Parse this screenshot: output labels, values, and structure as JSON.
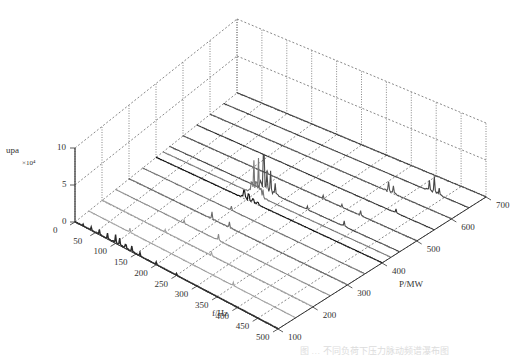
{
  "chart_data": {
    "type": "waterfall-3d",
    "title": "",
    "xlabel": "f/Hz",
    "ylabel": "P/MW",
    "zlabel": "upa",
    "z_multiplier": "×10⁴",
    "x_ticks": [
      0,
      50,
      100,
      150,
      200,
      250,
      300,
      350,
      400,
      450,
      500
    ],
    "y_ticks": [
      100,
      200,
      300,
      400,
      500,
      600,
      700
    ],
    "z_ticks": [
      0,
      5,
      10
    ],
    "xlim": [
      0,
      500
    ],
    "ylim": [
      100,
      700
    ],
    "zlim": [
      0,
      10
    ],
    "grid": true,
    "series": [
      {
        "name": "P=100",
        "power": 100,
        "color": "#2a2a2a",
        "peaks": [
          [
            20,
            0.3
          ],
          [
            40,
            0.5
          ],
          [
            60,
            0.7
          ],
          [
            80,
            0.8
          ],
          [
            100,
            1.2
          ],
          [
            110,
            1.0
          ],
          [
            125,
            0.9
          ],
          [
            140,
            0.8
          ],
          [
            160,
            0.5
          ],
          [
            200,
            0.4
          ],
          [
            250,
            0.3
          ]
        ]
      },
      {
        "name": "P=150",
        "power": 150,
        "color": "#a0a0a0",
        "peaks": [
          [
            100,
            0.6
          ],
          [
            350,
            0.5
          ]
        ]
      },
      {
        "name": "P=200",
        "power": 200,
        "color": "#a0a0a0",
        "peaks": [
          [
            150,
            0.4
          ],
          [
            260,
            0.5
          ]
        ]
      },
      {
        "name": "P=250",
        "power": 250,
        "color": "#8a8a8a",
        "peaks": [
          [
            160,
            0.5
          ],
          [
            240,
            0.9
          ]
        ]
      },
      {
        "name": "P=300",
        "power": 300,
        "color": "#6a6a6a",
        "peaks": [
          [
            190,
            1.0
          ],
          [
            230,
            0.8
          ]
        ]
      },
      {
        "name": "P=350",
        "power": 350,
        "color": "#707070",
        "peaks": [
          [
            200,
            0.6
          ]
        ]
      },
      {
        "name": "P=400",
        "power": 400,
        "color": "#111111",
        "peaks": [
          [
            195,
            1.8
          ],
          [
            205,
            1.5
          ],
          [
            215,
            0.9
          ],
          [
            225,
            0.6
          ]
        ]
      },
      {
        "name": "P=425",
        "power": 425,
        "color": "#777777",
        "peaks": [
          [
            195,
            2.5
          ],
          [
            200,
            4.6
          ],
          [
            205,
            3.0
          ],
          [
            210,
            5.2
          ],
          [
            215,
            2.0
          ],
          [
            220,
            1.2
          ]
        ]
      },
      {
        "name": "P=450",
        "power": 450,
        "color": "#4a4a4a",
        "peaks": [
          [
            205,
            7.8
          ],
          [
            212,
            2.5
          ],
          [
            220,
            3.0
          ],
          [
            230,
            1.6
          ],
          [
            300,
            0.5
          ],
          [
            380,
            0.8
          ]
        ]
      },
      {
        "name": "P=500",
        "power": 500,
        "color": "#555555",
        "peaks": [
          [
            180,
            0.4
          ],
          [
            300,
            0.5
          ],
          [
            340,
            0.4
          ],
          [
            380,
            0.7
          ]
        ]
      },
      {
        "name": "P=550",
        "power": 550,
        "color": "#333333",
        "peaks": [
          [
            420,
            0.6
          ]
        ]
      },
      {
        "name": "P=600",
        "power": 600,
        "color": "#555555",
        "peaks": [
          [
            370,
            1.4
          ],
          [
            380,
            1.1
          ]
        ]
      },
      {
        "name": "P=650",
        "power": 650,
        "color": "#444444",
        "peaks": [
          [
            420,
            1.5
          ],
          [
            430,
            2.3
          ],
          [
            440,
            1.0
          ]
        ]
      },
      {
        "name": "P=700",
        "power": 700,
        "color": "#444444",
        "peaks": []
      }
    ]
  },
  "caption": "图 … 不同负荷下压力脉动频谱瀑布图"
}
